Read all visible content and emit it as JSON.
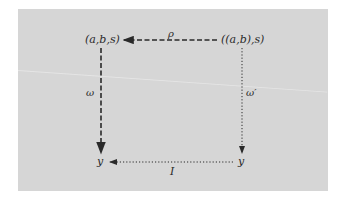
{
  "diagram": {
    "nodes": {
      "top_left": "(a,b,s)",
      "top_right": "((a,b),s)",
      "bottom_left": "y",
      "bottom_right": "y"
    },
    "arrows": {
      "top": {
        "label": "ρ",
        "from": "((a,b),s)",
        "to": "(a,b,s)",
        "style": "dashed"
      },
      "left": {
        "label": "ω",
        "from": "(a,b,s)",
        "to": "y",
        "style": "dashed"
      },
      "right": {
        "label": "ω′",
        "from": "((a,b),s)",
        "to": "y",
        "style": "dotted"
      },
      "bottom": {
        "label": "I",
        "from": "y",
        "to": "y",
        "style": "dotted"
      }
    },
    "colors": {
      "background": "#d6d6d6",
      "ink": "#2a2a2a",
      "margin": "#ffffff"
    }
  }
}
